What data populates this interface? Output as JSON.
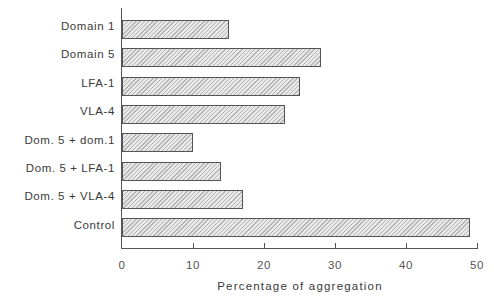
{
  "chart_data": {
    "type": "bar",
    "orientation": "horizontal",
    "title": "",
    "categories": [
      "Domain 1",
      "Domain 5",
      "LFA-1",
      "VLA-4",
      "Dom. 5 + dom.1",
      "Dom. 5 + LFA-1",
      "Dom. 5 + VLA-4",
      "Control"
    ],
    "values": [
      15,
      28,
      25,
      23,
      10,
      14,
      17,
      49
    ],
    "xlabel": "Percentage of aggregation",
    "ylabel": "",
    "xlim": [
      0,
      50
    ],
    "xticks": [
      "0",
      "10",
      "20",
      "30",
      "40",
      "50"
    ],
    "grid": false,
    "legend": null,
    "bar_fill": "hatched light gray"
  }
}
